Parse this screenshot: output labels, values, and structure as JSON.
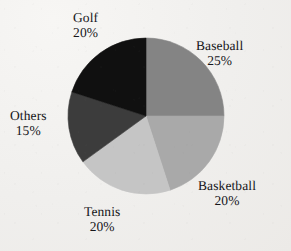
{
  "chart_data": {
    "type": "pie",
    "title": "",
    "categories": [
      "Baseball",
      "Basketball",
      "Tennis",
      "Others",
      "Golf"
    ],
    "values": [
      25,
      20,
      20,
      15,
      20
    ],
    "unit": "%",
    "total": 100,
    "start_angle_deg": 0,
    "direction": "clockwise",
    "legend": "none",
    "grid": false,
    "labels_position": "outside",
    "slices": [
      {
        "label": "Baseball",
        "value": 25,
        "value_text": "25%",
        "color": "#848484",
        "start_deg": 0,
        "sweep_deg": 90
      },
      {
        "label": "Basketball",
        "value": 20,
        "value_text": "20%",
        "color": "#a9a9a9",
        "start_deg": 90,
        "sweep_deg": 72
      },
      {
        "label": "Tennis",
        "value": 20,
        "value_text": "20%",
        "color": "#c5c5c5",
        "start_deg": 162,
        "sweep_deg": 72
      },
      {
        "label": "Others",
        "value": 15,
        "value_text": "15%",
        "color": "#3c3c3c",
        "start_deg": 234,
        "sweep_deg": 54
      },
      {
        "label": "Golf",
        "value": 20,
        "value_text": "20%",
        "color": "#101010",
        "start_deg": 288,
        "sweep_deg": 72
      }
    ]
  },
  "figure": {
    "background_color": "#f2f1ef",
    "text_color": "#16161a",
    "center_x": 146,
    "center_y": 116,
    "radius": 78
  }
}
